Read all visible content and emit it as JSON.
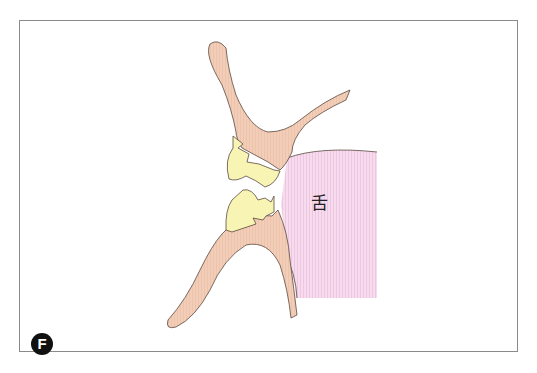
{
  "figure": {
    "panel_label": "F",
    "annotations": [
      {
        "id": "tongue",
        "text": "舌",
        "x": 311,
        "y": 196
      }
    ],
    "colors": {
      "bone": "#f2cdb8",
      "tooth": "#f8f4b4",
      "tongue": "#f4d4ea",
      "outline": "#5a4a40",
      "frame": "#8a8a8a"
    },
    "structures": [
      "upper-jaw-bone",
      "lower-jaw-bone",
      "upper-tooth",
      "lower-tooth",
      "tongue"
    ]
  }
}
